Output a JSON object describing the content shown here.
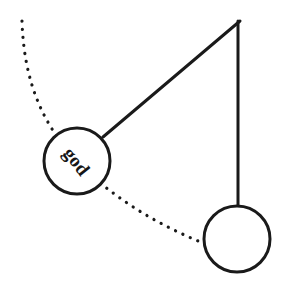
{
  "figure": {
    "background_color": "#ffffff",
    "stroke_color": "#1a1a1a",
    "width": 289,
    "height": 287
  },
  "labels": {
    "bob_label": "god",
    "bob_label_rotation_deg": 52
  },
  "geometry": {
    "pivot": {
      "x": 240,
      "y": 21
    },
    "rod_swung": {
      "from_x": 240,
      "from_y": 21,
      "to_x": 103,
      "to_y": 137,
      "stroke_width": 3
    },
    "rod_rest": {
      "from_x": 238,
      "from_y": 21,
      "to_x": 238,
      "to_y": 206,
      "stroke_width": 3
    },
    "bob_swung": {
      "cx": 77,
      "cy": 161,
      "r": 33,
      "stroke_width": 3
    },
    "bob_rest": {
      "cx": 237,
      "cy": 239,
      "r": 33,
      "stroke_width": 3
    },
    "swing_arc": {
      "start_x": 22,
      "start_y": 21,
      "end_x": 203,
      "end_y": 243,
      "dot_radius": 1.6,
      "dot_spacing": 8
    }
  },
  "chart_data": {
    "type": "diagram",
    "elements": [
      {
        "name": "pivot-point",
        "kind": "point",
        "x": 240,
        "y": 21
      },
      {
        "name": "rod-displaced",
        "kind": "line",
        "x1": 240,
        "y1": 21,
        "x2": 103,
        "y2": 137
      },
      {
        "name": "rod-equilibrium",
        "kind": "line",
        "x1": 238,
        "y1": 21,
        "x2": 238,
        "y2": 206
      },
      {
        "name": "bob-displaced",
        "kind": "circle",
        "cx": 77,
        "cy": 161,
        "r": 33,
        "label": "god"
      },
      {
        "name": "bob-equilibrium",
        "kind": "circle",
        "cx": 237,
        "cy": 239,
        "r": 33,
        "label": ""
      },
      {
        "name": "swing-path",
        "kind": "dotted-arc",
        "from": [
          22,
          21
        ],
        "to": [
          203,
          243
        ]
      }
    ]
  }
}
